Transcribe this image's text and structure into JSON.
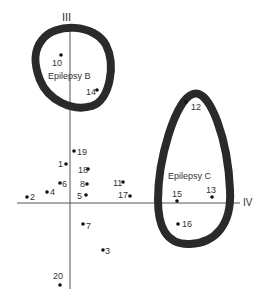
{
  "diagram": {
    "axes": {
      "vertical_label": "III",
      "horizontal_label": "IV"
    },
    "clusters": [
      {
        "id": "B",
        "label": "Epilepsy B",
        "member_points": [
          "10",
          "14"
        ]
      },
      {
        "id": "C",
        "label": "Epilepsy C",
        "member_points": [
          "12",
          "13",
          "15",
          "16"
        ]
      }
    ],
    "points": [
      {
        "label": "1",
        "x": 66,
        "y": 164
      },
      {
        "label": "2",
        "x": 27,
        "y": 197
      },
      {
        "label": "3",
        "x": 103,
        "y": 250
      },
      {
        "label": "4",
        "x": 47,
        "y": 192
      },
      {
        "label": "5",
        "x": 86,
        "y": 195
      },
      {
        "label": "6",
        "x": 60,
        "y": 183
      },
      {
        "label": "7",
        "x": 83,
        "y": 224
      },
      {
        "label": "8",
        "x": 87,
        "y": 184
      },
      {
        "label": "10",
        "x": 61,
        "y": 55
      },
      {
        "label": "11",
        "x": 123,
        "y": 182
      },
      {
        "label": "12",
        "x": 186,
        "y": 102
      },
      {
        "label": "13",
        "x": 212,
        "y": 197
      },
      {
        "label": "14",
        "x": 97,
        "y": 90
      },
      {
        "label": "15",
        "x": 177,
        "y": 201
      },
      {
        "label": "16",
        "x": 178,
        "y": 224
      },
      {
        "label": "17",
        "x": 130,
        "y": 196
      },
      {
        "label": "18",
        "x": 88,
        "y": 169
      },
      {
        "label": "19",
        "x": 74,
        "y": 151
      },
      {
        "label": "20",
        "x": 60,
        "y": 285
      }
    ]
  }
}
